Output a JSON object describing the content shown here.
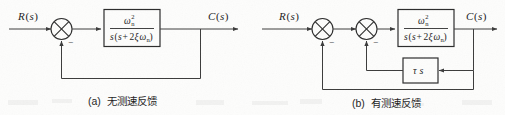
{
  "figure": {
    "type": "control-system-block-diagram",
    "background_color": "#fdfdfc",
    "line_color": "#3a3a3a"
  },
  "diagram_a": {
    "caption_index": "(a)",
    "caption_text": "无测速反馈",
    "input_label_main": "R",
    "input_label_paren_open": "(",
    "input_label_var": "s",
    "input_label_paren_close": ")",
    "output_label_main": "C",
    "output_label_paren_open": "(",
    "output_label_var": "s",
    "output_label_paren_close": ")",
    "summing_junction": {
      "name": "summing-junction",
      "sign_label": "−",
      "glyph": "circle-with-cross"
    },
    "plant_block": {
      "numerator_omega": "ω",
      "numerator_sub": "n",
      "numerator_sup": "2",
      "denominator_s1": "s",
      "denominator_open": "(",
      "denominator_s2": "s",
      "denominator_plus": "+",
      "denominator_coeff": "2",
      "denominator_zeta": "ξ",
      "denominator_omega": "ω",
      "denominator_sub": "n",
      "denominator_close": ")"
    }
  },
  "diagram_b": {
    "caption_index": "(b)",
    "caption_text": "有测速反馈",
    "input_label_main": "R",
    "input_label_paren_open": "(",
    "input_label_var": "s",
    "input_label_paren_close": ")",
    "output_label_main": "C",
    "output_label_paren_open": "(",
    "output_label_var": "s",
    "output_label_paren_close": ")",
    "summing_junction_outer": {
      "name": "summing-junction-outer",
      "sign_label": "−",
      "glyph": "circle-with-cross"
    },
    "summing_junction_inner": {
      "name": "summing-junction-inner",
      "sign_label": "−",
      "glyph": "circle-with-cross"
    },
    "plant_block": {
      "numerator_omega": "ω",
      "numerator_sub": "n",
      "numerator_sup": "2",
      "denominator_s1": "s",
      "denominator_open": "(",
      "denominator_s2": "s",
      "denominator_plus": "+",
      "denominator_coeff": "2",
      "denominator_zeta": "ξ",
      "denominator_omega": "ω",
      "denominator_sub": "n",
      "denominator_close": ")"
    },
    "tacho_block": {
      "label_tau": "τ",
      "label_s": "s"
    }
  }
}
